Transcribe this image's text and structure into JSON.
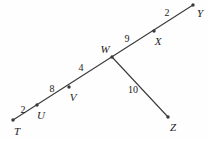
{
  "figure": {
    "type": "geometry-line-diagram",
    "width": 209,
    "height": 141,
    "background_color": "#fefefe",
    "stroke_color": "#3a3a3a",
    "text_color": "#1b1b1b"
  },
  "points": [
    {
      "name": "T",
      "label": "T",
      "x": 13,
      "y": 120,
      "label_x": 17,
      "label_y": 131
    },
    {
      "name": "U",
      "label": "U",
      "x": 37,
      "y": 105,
      "label_x": 41,
      "label_y": 115
    },
    {
      "name": "V",
      "label": "V",
      "x": 69,
      "y": 87,
      "label_x": 73,
      "label_y": 97
    },
    {
      "name": "W",
      "label": "W",
      "x": 112,
      "y": 57,
      "label_x": 105,
      "label_y": 49
    },
    {
      "name": "X",
      "label": "X",
      "x": 154,
      "y": 31,
      "label_x": 158,
      "label_y": 41
    },
    {
      "name": "Y",
      "label": "Y",
      "x": 193,
      "y": 5,
      "label_x": 200,
      "label_y": 13
    },
    {
      "name": "Z",
      "label": "Z",
      "x": 168,
      "y": 117,
      "label_x": 173,
      "label_y": 127
    }
  ],
  "segments": [
    {
      "name": "T-U",
      "from": "T",
      "to": "U",
      "measure": "2",
      "label_x": 23,
      "label_y": 110
    },
    {
      "name": "U-V",
      "from": "U",
      "to": "V",
      "measure": "8",
      "label_x": 52,
      "label_y": 89
    },
    {
      "name": "V-W",
      "from": "V",
      "to": "W",
      "measure": "4",
      "label_x": 81,
      "label_y": 68
    },
    {
      "name": "W-X",
      "from": "W",
      "to": "X",
      "measure": "9",
      "label_x": 127,
      "label_y": 39
    },
    {
      "name": "X-Y",
      "from": "X",
      "to": "Y",
      "measure": "2",
      "label_x": 167,
      "label_y": 13
    },
    {
      "name": "W-Z",
      "from": "W",
      "to": "Z",
      "measure": "10",
      "label_x": 133,
      "label_y": 90
    }
  ],
  "lines": [
    {
      "name": "main-line-T-to-Y",
      "x1": 13,
      "y1": 120,
      "x2": 193,
      "y2": 5
    },
    {
      "name": "branch-line-W-to-Z",
      "x1": 112,
      "y1": 57,
      "x2": 168,
      "y2": 117
    }
  ]
}
